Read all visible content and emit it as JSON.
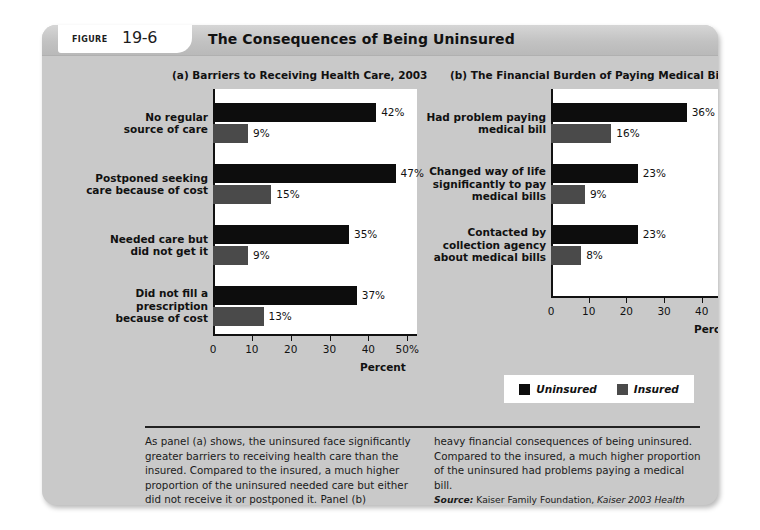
{
  "figure": {
    "label": "Figure",
    "number": "19-6",
    "title": "The Consequences of Being Uninsured"
  },
  "legend": {
    "uninsured": "Uninsured",
    "insured": "Insured",
    "colors": {
      "uninsured": "#0d0d0d",
      "insured": "#4a4a4a"
    }
  },
  "caption": {
    "left": "As panel (a) shows, the uninsured face significantly greater barriers to receiving health care than the insured. Compared to the insured, a much higher proportion of the uninsured needed care but either did not receive it or postponed it. Panel (b) illustrates the",
    "right": "heavy financial consequences of being uninsured. Compared to the insured, a much higher proportion of the uninsured had problems paying a medical bill.",
    "source_label": "Source:",
    "source_text": " Kaiser Family Foundation, ",
    "source_title": "Kaiser 2003 Health Insurance Survey."
  },
  "chart_data": [
    {
      "type": "bar",
      "orientation": "horizontal",
      "title": "(a) Barriers to Receiving Health Care, 2003",
      "xlabel": "Percent",
      "ylabel": "",
      "xlim": [
        0,
        52
      ],
      "ticks": [
        0,
        10,
        20,
        30,
        40,
        50
      ],
      "tick_labels": [
        "0",
        "10",
        "20",
        "30",
        "40",
        "50%"
      ],
      "grid": false,
      "legend_position": "bottom-center-shared",
      "categories": [
        "No regular\nsource of care",
        "Postponed seeking\ncare because of cost",
        "Needed care but\ndid not get it",
        "Did not fill a\nprescription\nbecause of cost"
      ],
      "series": [
        {
          "name": "Uninsured",
          "values": [
            42,
            47,
            35,
            37
          ],
          "labels": [
            "42%",
            "47%",
            "35%",
            "37%"
          ]
        },
        {
          "name": "Insured",
          "values": [
            9,
            15,
            9,
            13
          ],
          "labels": [
            "9%",
            "15%",
            "9%",
            "13%"
          ]
        }
      ]
    },
    {
      "type": "bar",
      "orientation": "horizontal",
      "title": "(b) The Financial Burden of Paying Medical Bills, 2003",
      "xlabel": "Percent",
      "ylabel": "",
      "xlim": [
        0,
        52
      ],
      "ticks": [
        0,
        10,
        20,
        30,
        40,
        50
      ],
      "tick_labels": [
        "0",
        "10",
        "20",
        "30",
        "40",
        "50%"
      ],
      "grid": false,
      "legend_position": "bottom-center-shared",
      "categories": [
        "Had problem paying\nmedical bill",
        "Changed way of life\nsignificantly to pay\nmedical bills",
        "Contacted by\ncollection agency\nabout medical bills"
      ],
      "series": [
        {
          "name": "Uninsured",
          "values": [
            36,
            23,
            23
          ],
          "labels": [
            "36%",
            "23%",
            "23%"
          ]
        },
        {
          "name": "Insured",
          "values": [
            16,
            9,
            8
          ],
          "labels": [
            "16%",
            "9%",
            "8%"
          ]
        }
      ]
    }
  ]
}
